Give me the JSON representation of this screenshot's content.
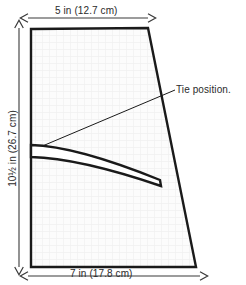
{
  "diagram": {
    "annotations": {
      "tie_position": "Tie position."
    },
    "dimensions": {
      "top": {
        "label": "5 in (12.7 cm)",
        "inches": 5,
        "centimeters": 12.7,
        "edge": "top"
      },
      "bottom": {
        "label": "7 in  (17.8 cm)",
        "inches": 7,
        "centimeters": 17.8,
        "edge": "bottom"
      },
      "left": {
        "label": "10½ in (26.7 cm)",
        "inches": 10.5,
        "centimeters": 26.7,
        "edge": "left"
      }
    },
    "colors": {
      "outline": "#1a1a1a",
      "fill": "#fbfbfb",
      "grid": "#f2f2f2",
      "dimension_line": "#3a3a3a",
      "text": "#2b2b2b",
      "leader_line": "#1a1a1a",
      "background": "#ffffff"
    },
    "shape": {
      "name": "panel-outline",
      "type": "quadrilateral",
      "points": "31,29 148,28 196,267 31,267"
    },
    "tie_band": {
      "name": "tie-band",
      "description": "curved sash strip attached at left edge",
      "outer_path": "M31,145 C70,146 118,163 160,180",
      "inner_path": "M31,157 C72,158 120,172 161,186",
      "tip_path": "M160,180 L161,186"
    },
    "leader": {
      "name": "tie-position-leader",
      "path": "M33,150 L175,90"
    }
  }
}
